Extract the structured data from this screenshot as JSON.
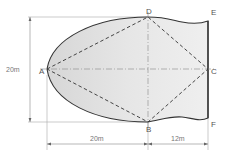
{
  "diagram": {
    "points": {
      "A": {
        "label": "A"
      },
      "B": {
        "label": "B"
      },
      "C": {
        "label": "C"
      },
      "D": {
        "label": "D"
      },
      "E": {
        "label": "E"
      },
      "F": {
        "label": "F"
      }
    },
    "dimensions": {
      "height": "20m",
      "left_width": "20m",
      "right_width": "12m"
    },
    "colors": {
      "fill": "#e2e2e2",
      "outline": "#333333",
      "dashed": "#444444",
      "guide": "#999999"
    }
  }
}
